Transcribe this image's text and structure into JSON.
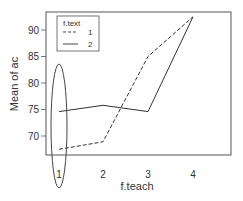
{
  "chart_data": {
    "type": "line",
    "title": "",
    "xlabel": "f.teach",
    "ylabel": "Mean of ac",
    "categories": [
      "1",
      "2",
      "3",
      "4"
    ],
    "yticks": [
      70,
      75,
      80,
      85,
      90
    ],
    "ylim": [
      66.5,
      93
    ],
    "legend": {
      "title": "f.text",
      "position": "top-left",
      "entries": [
        {
          "label": "1",
          "style": "dashed"
        },
        {
          "label": "2",
          "style": "solid"
        }
      ]
    },
    "series": [
      {
        "name": "1",
        "style": "dashed",
        "values": [
          67.5,
          68.9,
          85.0,
          92.5
        ]
      },
      {
        "name": "2",
        "style": "solid",
        "values": [
          74.6,
          75.8,
          74.6,
          92.5
        ]
      }
    ],
    "annotations": [
      {
        "type": "ellipse",
        "around": "x=1",
        "description": "Ellipse highlighting the x=1 category spanning both series values and the tick label"
      }
    ],
    "grid": false,
    "colors": {
      "line": "#333333",
      "axis": "#555555",
      "ellipse": "#444444"
    }
  }
}
